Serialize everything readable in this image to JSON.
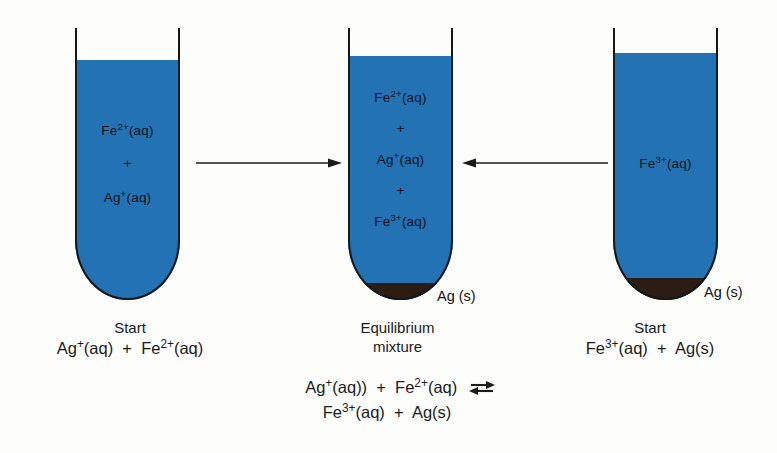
{
  "figure": {
    "type": "chemistry-equilibrium-diagram",
    "background_color": "#fdfdfc",
    "solution_color": "#2272b4",
    "precipitate_color": "#2b1d14",
    "outline_color": "#16181a"
  },
  "tubes": [
    {
      "id": "left",
      "species": [
        {
          "formula_html": "Fe<sup>2+</sup>(aq)",
          "text": "Fe2+(aq)"
        },
        {
          "formula_html": "+",
          "text": "+"
        },
        {
          "formula_html": "Ag<sup>+</sup>(aq)",
          "text": "Ag+(aq)"
        }
      ],
      "has_precipitate": false,
      "precipitate_label": "",
      "caption_title": "Start",
      "caption_formula_html": "Ag<sup>+</sup>(aq) &nbsp;+&nbsp; Fe<sup>2+</sup>(aq)"
    },
    {
      "id": "middle",
      "species": [
        {
          "formula_html": "Fe<sup>2+</sup>(aq)",
          "text": "Fe2+(aq)"
        },
        {
          "formula_html": "+",
          "text": "+"
        },
        {
          "formula_html": "Ag<sup>+</sup>(aq)",
          "text": "Ag+(aq)"
        },
        {
          "formula_html": "+",
          "text": "+"
        },
        {
          "formula_html": "Fe<sup>3+</sup>(aq)",
          "text": "Fe3+(aq)"
        }
      ],
      "has_precipitate": true,
      "precipitate_label": "Ag (s)",
      "caption_title_line1": "Equilibrium",
      "caption_title_line2": "mixture"
    },
    {
      "id": "right",
      "species": [
        {
          "formula_html": "Fe<sup>3+</sup>(aq)",
          "text": "Fe3+(aq)"
        }
      ],
      "has_precipitate": true,
      "precipitate_label": "Ag (s)",
      "caption_title": "Start",
      "caption_formula_html": "Fe<sup>3+</sup>(aq) &nbsp;+&nbsp; Ag(s)"
    }
  ],
  "arrows": [
    {
      "id": "left-to-middle",
      "direction": "right"
    },
    {
      "id": "right-to-middle",
      "direction": "left"
    }
  ],
  "equilibrium_equation": {
    "line1_html": "Ag<sup>+</sup>(aq)) &nbsp;+&nbsp; Fe<sup>2+</sup>(aq)",
    "line2_html": "Fe<sup>3+</sup>(aq) &nbsp;+&nbsp; Ag(s)",
    "arrow_symbol": "equilibrium-double-arrow"
  }
}
